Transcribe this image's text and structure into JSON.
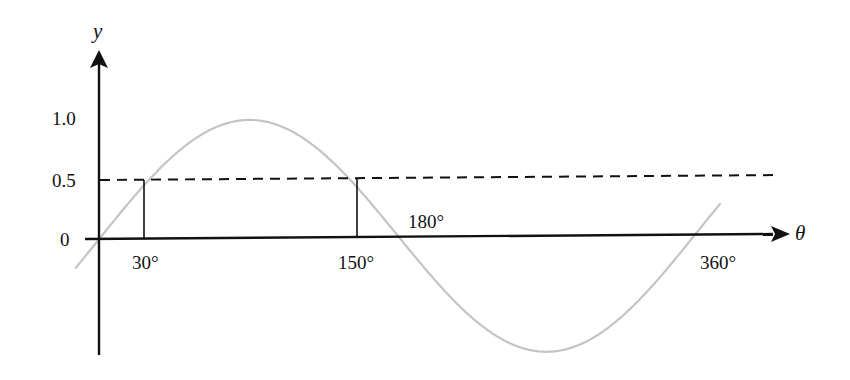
{
  "chart_data": {
    "type": "line",
    "title": "",
    "xlabel": "θ",
    "ylabel": "y",
    "function": "y = sin θ",
    "x_range_deg": [
      -15,
      375
    ],
    "ylim": [
      -1,
      1
    ],
    "grid": false,
    "legend": null,
    "y_ticks": [
      {
        "value": 1.0,
        "label": "1.0"
      },
      {
        "value": 0.5,
        "label": "0.5"
      },
      {
        "value": 0,
        "label": "0"
      }
    ],
    "x_ticks": [
      {
        "value": 30,
        "label": "30°"
      },
      {
        "value": 150,
        "label": "150°"
      },
      {
        "value": 180,
        "label": "180°"
      },
      {
        "value": 360,
        "label": "360°"
      }
    ],
    "series": [
      {
        "name": "sin θ",
        "color": "#c4c4c4",
        "x": [
          -15,
          0,
          30,
          60,
          90,
          120,
          150,
          180,
          210,
          240,
          270,
          300,
          330,
          360,
          375
        ],
        "values": [
          -0.26,
          0,
          0.5,
          0.87,
          1.0,
          0.87,
          0.5,
          0,
          -0.5,
          -0.87,
          -1.0,
          -0.87,
          -0.5,
          0,
          0.26
        ]
      }
    ],
    "annotations": [
      {
        "type": "hline",
        "y": 0.5,
        "style": "dashed",
        "color": "#111111"
      },
      {
        "type": "vline",
        "x": 30,
        "from": 0,
        "to": 0.5,
        "color": "#111111"
      },
      {
        "type": "vline",
        "x": 150,
        "from": 0,
        "to": 0.5,
        "color": "#111111"
      }
    ]
  },
  "labels": {
    "y_axis": "y",
    "x_axis": "θ",
    "y_tick_1": "1.0",
    "y_tick_05": "0.5",
    "y_tick_0": "0",
    "x_tick_30": "30°",
    "x_tick_150": "150°",
    "x_tick_180": "180°",
    "x_tick_360": "360°"
  },
  "colors": {
    "curve": "#c4c4c4",
    "axes": "#111111"
  }
}
